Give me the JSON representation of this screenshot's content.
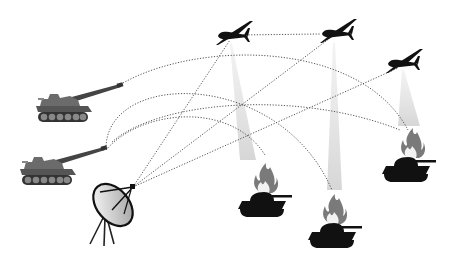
{
  "diagram": {
    "title": "Networked fires: drones relay targeting from satellite link to artillery against burning tanks",
    "colors": {
      "background": "#ffffff",
      "link_line": "#555555",
      "cone": "#d9d9d9",
      "silhouette": "#111111",
      "artillery": "#6b6b6b",
      "flame_outer": "#7a7a7a",
      "flame_inner": "#f2f2f2"
    },
    "nodes": [
      {
        "id": "artillery-1",
        "type": "self-propelled-gun",
        "x": 75,
        "y": 105
      },
      {
        "id": "artillery-2",
        "type": "self-propelled-gun",
        "x": 55,
        "y": 168
      },
      {
        "id": "ground-station",
        "type": "satellite-dish",
        "x": 112,
        "y": 215
      },
      {
        "id": "drone-1",
        "type": "uav",
        "x": 232,
        "y": 36
      },
      {
        "id": "drone-2",
        "type": "uav",
        "x": 336,
        "y": 34
      },
      {
        "id": "drone-3",
        "type": "uav",
        "x": 402,
        "y": 63
      },
      {
        "id": "tank-1",
        "type": "burning-tank",
        "x": 258,
        "y": 200
      },
      {
        "id": "tank-2",
        "type": "burning-tank",
        "x": 330,
        "y": 232
      },
      {
        "id": "tank-3",
        "type": "burning-tank",
        "x": 410,
        "y": 168
      }
    ],
    "links": [
      {
        "from": "drone-1",
        "to": "drone-2",
        "style": "dotted-straight"
      },
      {
        "from": "ground-station",
        "to": "drone-1",
        "style": "dotted-straight"
      },
      {
        "from": "ground-station",
        "to": "drone-2",
        "style": "dotted-straight"
      },
      {
        "from": "ground-station",
        "to": "drone-3",
        "style": "dotted-straight"
      },
      {
        "from": "artillery-1",
        "to": "tank-3",
        "style": "dotted-arc"
      },
      {
        "from": "artillery-2",
        "to": "tank-2",
        "style": "dotted-arc"
      },
      {
        "from": "artillery-2",
        "to": "tank-1",
        "style": "dotted-arc"
      }
    ]
  }
}
